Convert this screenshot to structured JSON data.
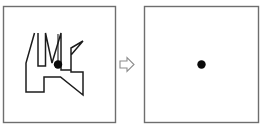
{
  "figure": {
    "background_color": "#ffffff",
    "width": 271,
    "height": 129
  },
  "panels": [
    {
      "id": "source-panel",
      "label": "Irregular shape panel",
      "x": 3.5,
      "y": 6.5,
      "width": 112,
      "height": 116,
      "border_color": "#6e6e6e",
      "fill_color": "#ffffff"
    },
    {
      "id": "result-panel",
      "label": "Centroid only panel",
      "x": 144.5,
      "y": 6.5,
      "width": 114,
      "height": 116,
      "border_color": "#6e6e6e",
      "fill_color": "#ffffff"
    }
  ],
  "shape": {
    "name": "irregular-polygon",
    "stroke_color": "#1c1c1c",
    "stroke_width": 1.5,
    "fill": "none",
    "points": "34.5,33 26,63 26,92 44,92 44,77 60.5,77 83,95 83,72 71,72 71,55 83,41 71,48 71,70 61,70 61,33 52,63 45.5,33 45.5,66 38,66 38,33",
    "vertices": [
      [
        34.5,
        33
      ],
      [
        26,
        63
      ],
      [
        26,
        92
      ],
      [
        44,
        92
      ],
      [
        44,
        77
      ],
      [
        60.5,
        77
      ],
      [
        83,
        95
      ],
      [
        83,
        72
      ],
      [
        71,
        72
      ],
      [
        71,
        55
      ],
      [
        83,
        41
      ],
      [
        71,
        48
      ],
      [
        71,
        70
      ],
      [
        61,
        70
      ],
      [
        61,
        33
      ],
      [
        52,
        63
      ],
      [
        45.5,
        33
      ],
      [
        45.5,
        66
      ],
      [
        38,
        66
      ],
      [
        38,
        33
      ]
    ]
  },
  "stem": {
    "name": "plumb-line",
    "x1": 58,
    "y1": 34,
    "x2": 58,
    "y2": 62,
    "color": "#1c1c1c"
  },
  "centroid_markers": [
    {
      "id": "source-centroid",
      "label": "Centroid marker in shape panel",
      "cx": 58,
      "cy": 64.5,
      "r": 4.2,
      "color": "#0a0a0a"
    },
    {
      "id": "result-centroid",
      "label": "Centroid marker in result panel",
      "cx": 201.5,
      "cy": 64.5,
      "r": 4.2,
      "color": "#0a0a0a"
    }
  ],
  "arrow": {
    "name": "right-arrow-icon",
    "direction": "right",
    "points": "120,61 127,61 127,57.5 134,64.5 127,71.5 127,68 120,68",
    "stroke_color": "#8c8c8c",
    "fill_color": "#ffffff"
  }
}
